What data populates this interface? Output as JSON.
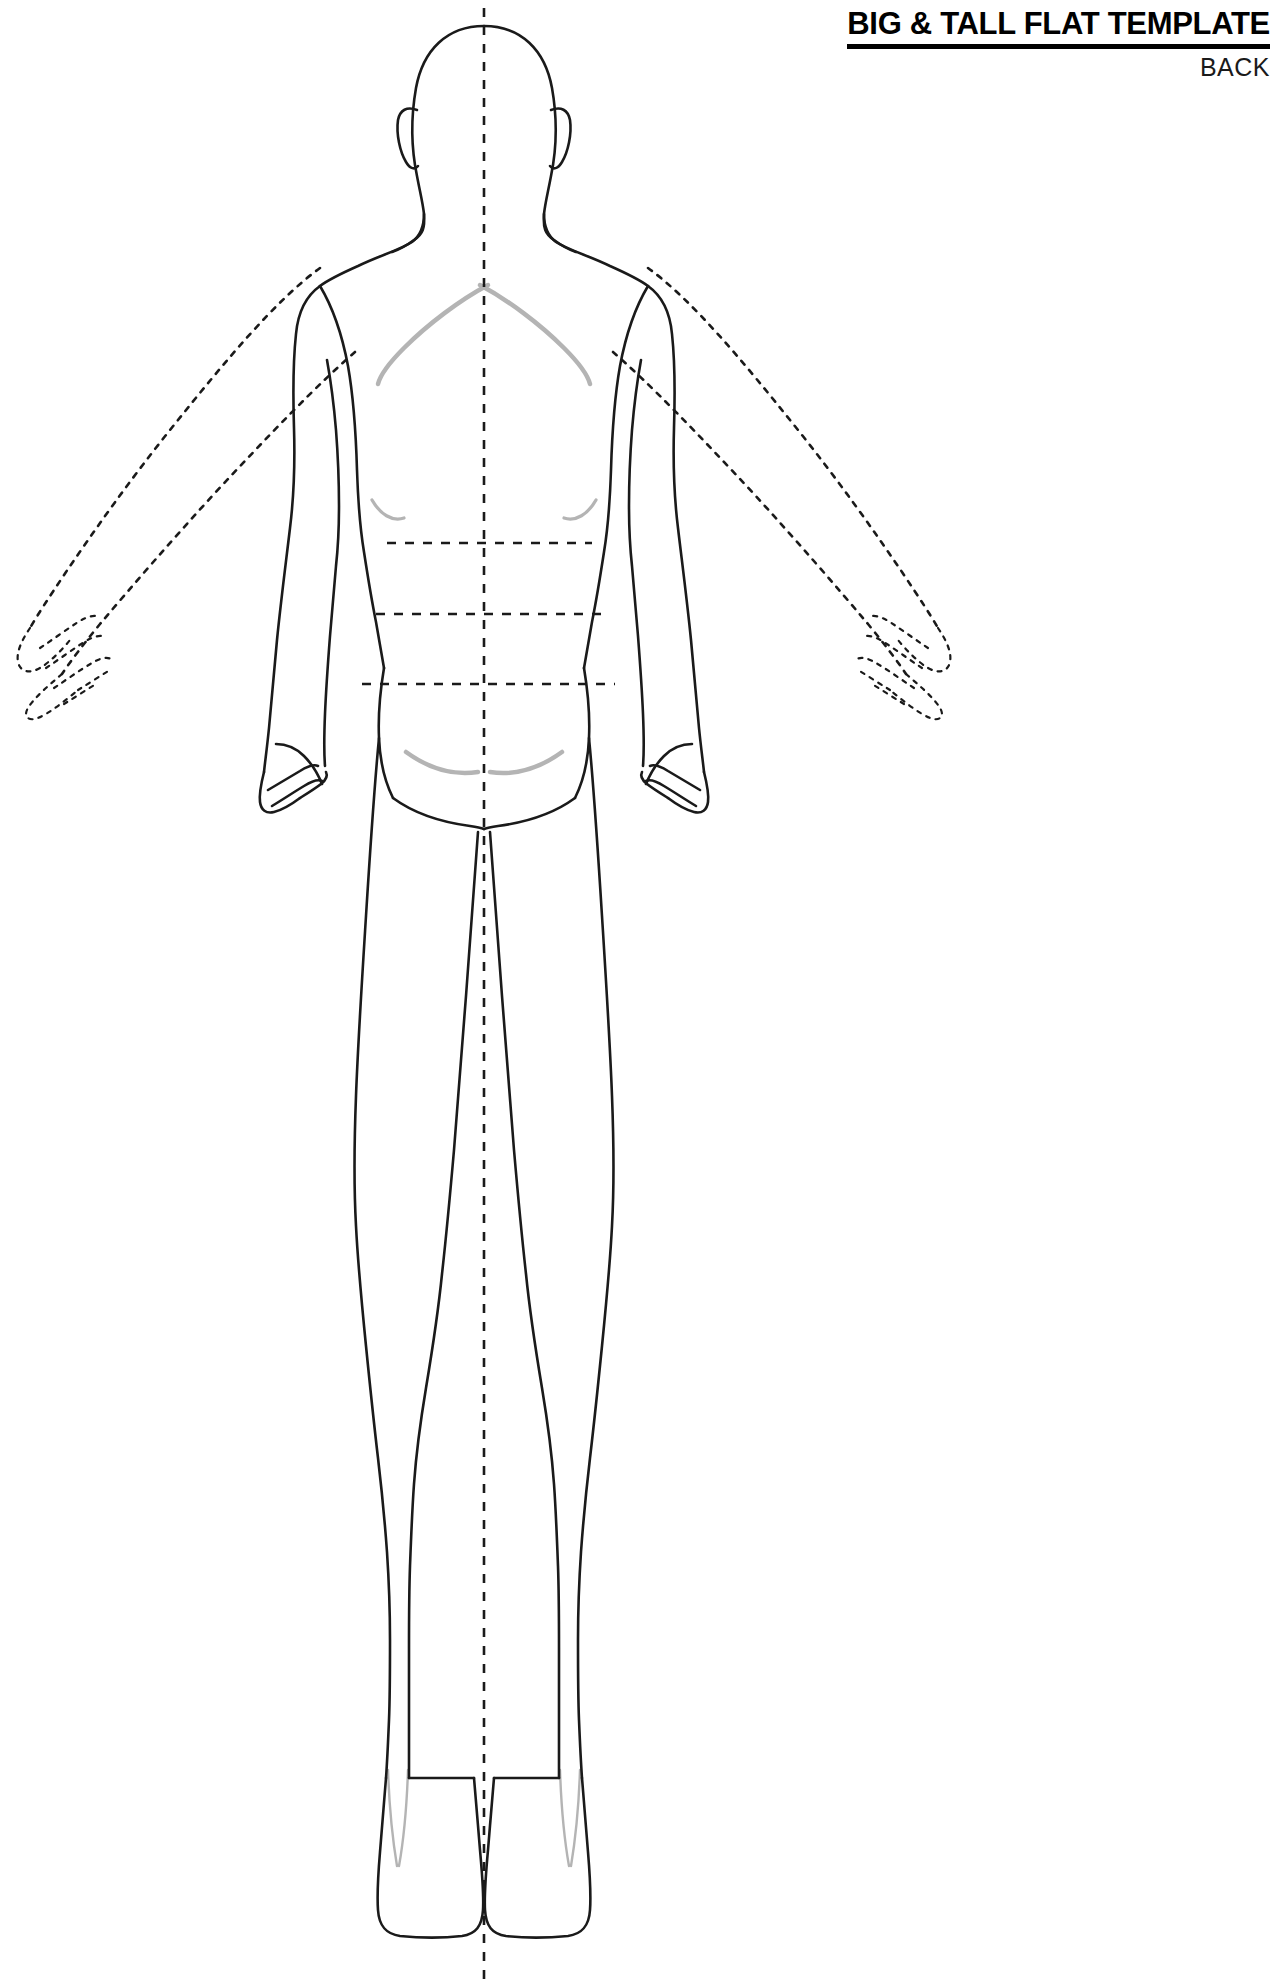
{
  "document": {
    "type": "apparel-flat-sketch-template",
    "title": "BIG & TALL FLAT TEMPLATE",
    "view_label": "BACK",
    "canvas": {
      "width": 1278,
      "height": 1988,
      "background": "#ffffff"
    }
  },
  "header": {
    "title": "BIG & TALL FLAT TEMPLATE",
    "subtitle": "BACK",
    "title_color": "#000000",
    "rule_color": "#000000",
    "alignment": "right"
  },
  "figure": {
    "name": "male-croquis-back-view",
    "pose": "standing, arms at sides, legs together",
    "outline_color": "#1a1a1a",
    "shading_color": "#b4b4b4",
    "guide_color": "#1a1a1a",
    "parts": {
      "head": "head-outline",
      "left_ear": "left-ear",
      "right_ear": "right-ear",
      "neck": "neck",
      "torso": "torso-back",
      "left_arm": "left-arm-down",
      "right_arm": "right-arm-down",
      "left_hand": "left-hand",
      "right_hand": "right-hand",
      "left_leg": "left-leg",
      "right_leg": "right-leg",
      "left_foot": "left-foot",
      "right_foot": "right-foot"
    },
    "ghost_arms": {
      "label": "outstretched-arm-alternate-pose",
      "style": "dotted",
      "left": "ghost-arm-left",
      "right": "ghost-arm-right"
    },
    "shading_marks": [
      "left-shoulder-blade",
      "right-shoulder-blade",
      "left-elbow-crease",
      "right-elbow-crease",
      "left-gluteal-fold",
      "right-gluteal-fold",
      "left-achilles-lines",
      "right-achilles-lines"
    ]
  },
  "guides": {
    "center_line": {
      "name": "vertical-center-line",
      "orientation": "vertical",
      "style": "dashed",
      "x": 484,
      "y_start": 8,
      "y_end": 1988
    },
    "horizontal_lines": [
      {
        "name": "chest-guide-line",
        "label": "chest",
        "y": 543,
        "x_start": 387,
        "x_end": 592
      },
      {
        "name": "waist-guide-line",
        "label": "waist",
        "y": 614,
        "x_start": 376,
        "x_end": 601
      },
      {
        "name": "hip-guide-line",
        "label": "hip",
        "y": 684,
        "x_start": 362,
        "x_end": 615
      }
    ]
  }
}
